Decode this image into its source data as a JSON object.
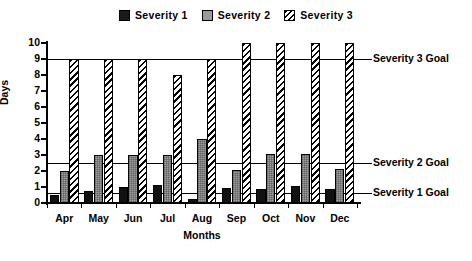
{
  "chart_data": {
    "type": "bar",
    "title": "",
    "subtitle": "",
    "xlabel": "Months",
    "ylabel": "Days",
    "categories": [
      "Apr",
      "May",
      "Jun",
      "Jul",
      "Aug",
      "Sep",
      "Oct",
      "Nov",
      "Dec"
    ],
    "series": [
      {
        "name": "Severity 1",
        "values": [
          0.5,
          0.75,
          1.0,
          1.1,
          0.25,
          0.95,
          0.85,
          1.05,
          0.9
        ]
      },
      {
        "name": "Severity 2",
        "values": [
          2.0,
          3.0,
          3.0,
          3.0,
          4.0,
          2.05,
          3.05,
          3.05,
          2.1
        ]
      },
      {
        "name": "Severity 3",
        "values": [
          9,
          9,
          9,
          8,
          9,
          10,
          10,
          10,
          10
        ]
      }
    ],
    "ylim": [
      0,
      10
    ],
    "y_ticks": [
      "0",
      "1",
      "2",
      "3",
      "4",
      "5",
      "6",
      "7",
      "8",
      "9",
      "10"
    ],
    "grid": false,
    "legend_position": "top-center",
    "reference_lines": [
      {
        "name": "Severity 3 Goal",
        "value": 9
      },
      {
        "name": "Severity 2 Goal",
        "value": 2.5
      },
      {
        "name": "Severity 1 Goal",
        "value": 0.6
      }
    ],
    "colors": {
      "severity_1": "#111111",
      "severity_2": "#9c9c9c",
      "severity_3": "#ffffff",
      "axis": "#000000"
    }
  },
  "legend": {
    "items": [
      {
        "label": "Severity 1",
        "swatch": "solid-black-swatch"
      },
      {
        "label": "Severity 2",
        "swatch": "gray-swatch"
      },
      {
        "label": "Severity 3",
        "swatch": "hatched-swatch"
      }
    ]
  }
}
